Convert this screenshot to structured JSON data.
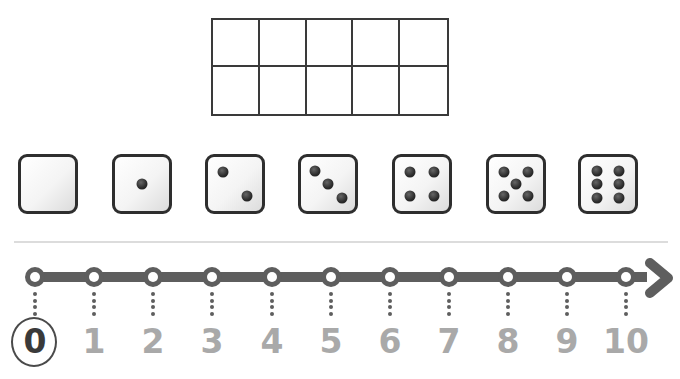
{
  "ten_frame": {
    "rows": 2,
    "columns": 5,
    "filled_cells": 0
  },
  "dice": [
    {
      "value": 0,
      "pips": []
    },
    {
      "value": 1,
      "pips": [
        [
          50,
          50
        ]
      ]
    },
    {
      "value": 2,
      "pips": [
        [
          28,
          28
        ],
        [
          72,
          72
        ]
      ]
    },
    {
      "value": 3,
      "pips": [
        [
          25,
          25
        ],
        [
          50,
          50
        ],
        [
          75,
          75
        ]
      ]
    },
    {
      "value": 4,
      "pips": [
        [
          28,
          28
        ],
        [
          72,
          28
        ],
        [
          28,
          72
        ],
        [
          72,
          72
        ]
      ]
    },
    {
      "value": 5,
      "pips": [
        [
          27,
          27
        ],
        [
          73,
          27
        ],
        [
          50,
          50
        ],
        [
          27,
          73
        ],
        [
          73,
          73
        ]
      ]
    },
    {
      "value": 6,
      "pips": [
        [
          30,
          25
        ],
        [
          70,
          25
        ],
        [
          30,
          50
        ],
        [
          70,
          50
        ],
        [
          30,
          75
        ],
        [
          70,
          75
        ]
      ]
    }
  ],
  "number_line": {
    "labels": [
      "0",
      "1",
      "2",
      "3",
      "4",
      "5",
      "6",
      "7",
      "8",
      "9",
      "10"
    ],
    "selected": "0",
    "line_color": "#5e5e5e",
    "label_color": "#a9a9a9",
    "selected_color": "#3a3a3a"
  }
}
